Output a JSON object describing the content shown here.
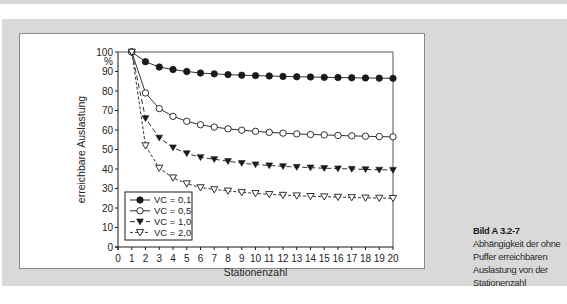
{
  "chart_data": {
    "type": "line",
    "title": "",
    "xlabel": "Stationenzahl",
    "ylabel": "erreichbare Auslastung",
    "y_unit_label": "%",
    "xlim": [
      0,
      20
    ],
    "ylim": [
      0,
      100
    ],
    "x_ticks": [
      0,
      1,
      2,
      3,
      4,
      5,
      6,
      7,
      8,
      9,
      10,
      11,
      12,
      13,
      14,
      15,
      16,
      17,
      18,
      19,
      20
    ],
    "y_ticks": [
      0,
      10,
      20,
      30,
      40,
      50,
      60,
      70,
      80,
      90,
      100
    ],
    "grid": false,
    "legend_position": "lower left (inside plot)",
    "x": [
      1,
      2,
      3,
      4,
      5,
      6,
      7,
      8,
      9,
      10,
      11,
      12,
      13,
      14,
      15,
      16,
      17,
      18,
      19,
      20
    ],
    "series": [
      {
        "name": "VC = 0,1",
        "marker": "filled-circle",
        "line": "solid",
        "values": [
          100,
          95,
          92.3,
          91,
          90,
          89.2,
          88.8,
          88.4,
          88.1,
          87.9,
          87.7,
          87.5,
          87.3,
          87.2,
          87.0,
          86.9,
          86.8,
          86.7,
          86.6,
          86.5
        ]
      },
      {
        "name": "VC = 0,5",
        "marker": "open-circle",
        "line": "solid",
        "values": [
          100,
          79,
          71,
          67,
          64.5,
          62.7,
          61.5,
          60.6,
          59.9,
          59.3,
          58.8,
          58.4,
          58.0,
          57.7,
          57.5,
          57.2,
          57.0,
          56.8,
          56.6,
          56.5
        ]
      },
      {
        "name": "VC = 1,0",
        "marker": "filled-triangle-down",
        "line": "dashed",
        "values": [
          100,
          66,
          56,
          51,
          48,
          46,
          45,
          44,
          43,
          42.3,
          41.8,
          41.4,
          41.0,
          40.7,
          40.4,
          40.2,
          40.0,
          39.8,
          39.6,
          39.5
        ]
      },
      {
        "name": "VC = 2,0",
        "marker": "open-triangle-down",
        "line": "dotted-dashed",
        "values": [
          100,
          52,
          40.5,
          35.5,
          32.5,
          30.5,
          29.5,
          28.8,
          28.0,
          27.5,
          27.0,
          26.6,
          26.3,
          26.0,
          25.8,
          25.6,
          25.4,
          25.2,
          25.1,
          25.0
        ]
      }
    ]
  },
  "caption": {
    "title": "Bild A 3.2-7",
    "lines": [
      "Abhängigkeit der ohne",
      "Puffer erreichbaren",
      "Auslastung von der",
      "Stationenzahl"
    ]
  },
  "colors": {
    "panel_bg": "#d9d9d9",
    "plot_bg": "#ffffff",
    "ink": "#1a1a1a"
  }
}
